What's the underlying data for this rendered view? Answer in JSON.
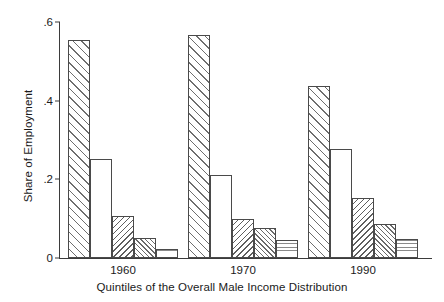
{
  "chart_data": {
    "type": "bar",
    "title": "",
    "xlabel": "Quintiles of the Overall Male Income Distribution",
    "ylabel": "Share of Employment",
    "categories": [
      "1960",
      "1970",
      "1990"
    ],
    "series": [
      {
        "name": "Quintile 1",
        "pattern": "hatch-wide",
        "values": [
          0.555,
          0.568,
          0.437
        ]
      },
      {
        "name": "Quintile 2",
        "pattern": "blank",
        "values": [
          0.253,
          0.21,
          0.277
        ]
      },
      {
        "name": "Quintile 3",
        "pattern": "hatch-dense",
        "values": [
          0.107,
          0.1,
          0.152
        ]
      },
      {
        "name": "Quintile 4",
        "pattern": "crosshatch",
        "values": [
          0.051,
          0.077,
          0.086
        ]
      },
      {
        "name": "Quintile 5",
        "pattern": "dots",
        "values": [
          0.022,
          0.045,
          0.049
        ]
      }
    ],
    "ylim": [
      0,
      0.6
    ],
    "yticks": [
      0,
      0.2,
      0.4,
      0.6
    ],
    "ytick_labels": [
      "0",
      ".2",
      ".4",
      ".6"
    ],
    "xtick_labels": [
      "1960",
      "1970",
      "1990"
    ],
    "grid": false,
    "legend": "none",
    "axis_color": "#3b3b3b",
    "bar_edge_color": "#4a4a4a",
    "background": "#ffffff"
  }
}
